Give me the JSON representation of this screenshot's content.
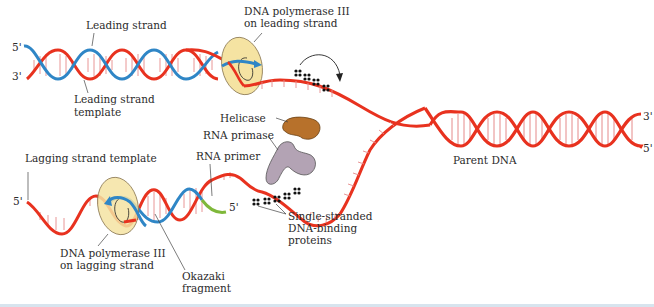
{
  "diagram": {
    "colors": {
      "parent_strand": "#e8321f",
      "new_strand": "#2f86c6",
      "rna_primer": "#7fb83a",
      "polymerase": "#f5e3a2",
      "helicase": "#b7712b",
      "primase": "#b3a3b4",
      "ssb": "#111111",
      "rungs": "#e58a8a"
    },
    "labels": {
      "leading_strand": "Leading strand",
      "leading_template_1": "Leading strand",
      "leading_template_2": "template",
      "pol_leading_1": "DNA polymerase III",
      "pol_leading_2": "on leading strand",
      "helicase": "Helicase",
      "rna_primase": "RNA primase",
      "rna_primer": "RNA primer",
      "parent_dna": "Parent DNA",
      "lagging_template": "Lagging strand template",
      "pol_lagging_1": "DNA polymerase III",
      "pol_lagging_2": "on lagging strand",
      "okazaki_1": "Okazaki",
      "okazaki_2": "fragment",
      "ssb_1": "Single-stranded",
      "ssb_2": "DNA-binding",
      "ssb_3": "proteins"
    },
    "ends": {
      "leading_top_left": "5'",
      "leading_bottom_left": "3'",
      "parent_top_right": "3'",
      "parent_bottom_right": "5'",
      "lagging_left": "5'",
      "lagging_primer_end": "5'"
    }
  }
}
